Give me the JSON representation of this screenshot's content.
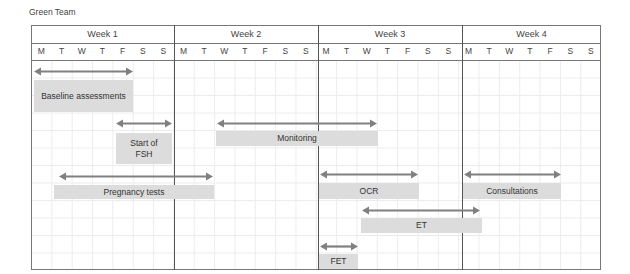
{
  "title": "Green Team",
  "weeks": [
    "Week 1",
    "Week 2",
    "Week 3",
    "Week 4"
  ],
  "days": [
    "M",
    "T",
    "W",
    "T",
    "F",
    "S",
    "S",
    "M",
    "T",
    "W",
    "T",
    "F",
    "S",
    "S",
    "M",
    "T",
    "W",
    "T",
    "F",
    "S",
    "S",
    "M",
    "T",
    "W",
    "T",
    "F",
    "S",
    "S"
  ],
  "activities": [
    {
      "label": "Baseline assessments",
      "start_day": 0,
      "end_day": 4,
      "week": "Week 1"
    },
    {
      "label": "Start of FSH",
      "start_day": 4,
      "end_day": 6,
      "week": "Week 1"
    },
    {
      "label": "Monitoring",
      "start_day": 9,
      "end_day": 16,
      "week": "Week 2-3"
    },
    {
      "label": "Pregnancy tests",
      "start_day": 1,
      "end_day": 8,
      "week": "Week 1-2"
    },
    {
      "label": "OCR",
      "start_day": 14,
      "end_day": 18,
      "week": "Week 3"
    },
    {
      "label": "Consultations",
      "start_day": 21,
      "end_day": 25,
      "week": "Week 4"
    },
    {
      "label": "ET",
      "start_day": 16,
      "end_day": 21,
      "week": "Week 3-4"
    },
    {
      "label": "FET",
      "start_day": 14,
      "end_day": 15,
      "week": "Week 3"
    }
  ],
  "colors": {
    "bar_fill": "#dcdcdc",
    "arrow": "#808080",
    "border": "#777777"
  }
}
